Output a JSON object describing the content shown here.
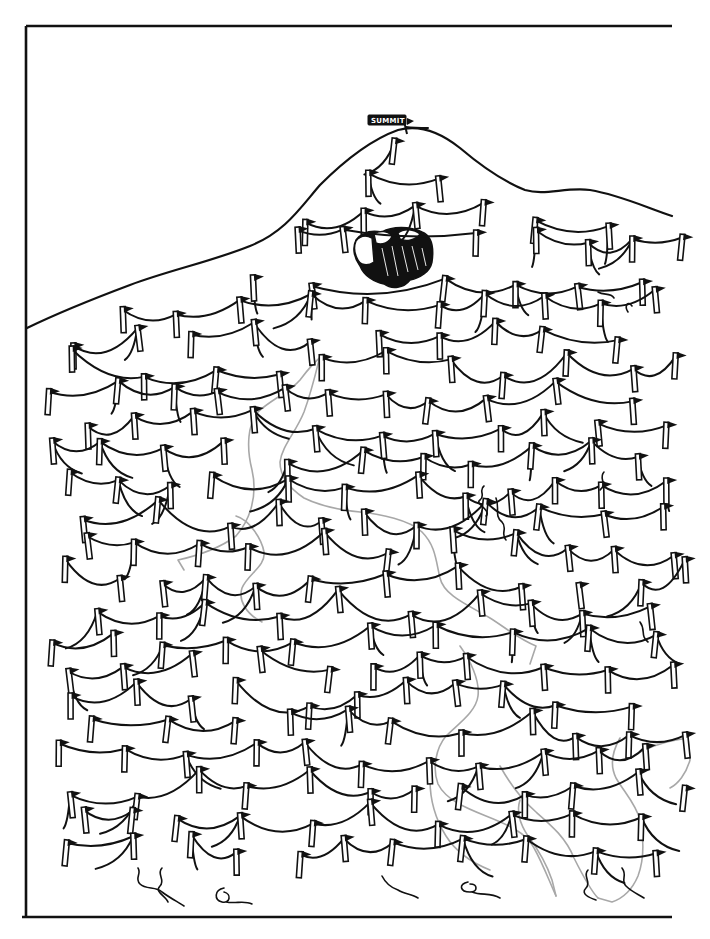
{
  "illustration": {
    "title": "Mountain rope-and-flag maze",
    "summit_sign": {
      "label": "SUMMIT"
    },
    "landmarks": [
      {
        "name": "summit",
        "x": 390,
        "y": 120
      },
      {
        "name": "boulder",
        "x": 392,
        "y": 255
      }
    ],
    "colors": {
      "ink": "#111111",
      "background": "#ffffff",
      "pencil_trace": "#a8a8a8"
    },
    "frame": {
      "left": 27,
      "top": 27,
      "right": 672,
      "bottom": 917,
      "open_side": "right"
    }
  }
}
